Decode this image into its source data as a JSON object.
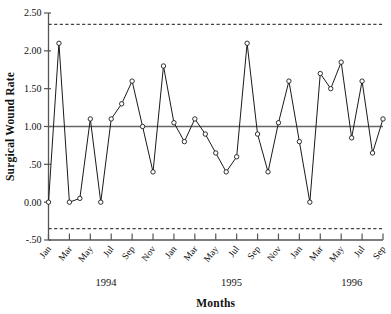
{
  "chart_data": {
    "type": "line",
    "title": "",
    "subtitle": "",
    "xlabel": "Months",
    "ylabel": "Surgical Wound Rate",
    "ylim": [
      -0.5,
      2.5
    ],
    "ytick_labels": [
      "2.50",
      "2.00",
      "1.50",
      "1.00",
      ".50",
      "0.00",
      "-.50"
    ],
    "ytick_values": [
      2.5,
      2.0,
      1.5,
      1.0,
      0.5,
      0.0,
      -0.5
    ],
    "grid": false,
    "legend_position": "none",
    "marker": "open-circle",
    "x": [
      "Jan 1994",
      "Feb 1994",
      "Mar 1994",
      "Apr 1994",
      "May 1994",
      "Jun 1994",
      "Jul 1994",
      "Aug 1994",
      "Sep 1994",
      "Oct 1994",
      "Nov 1994",
      "Dec 1994",
      "Jan 1995",
      "Feb 1995",
      "Mar 1995",
      "Apr 1995",
      "May 1995",
      "Jun 1995",
      "Jul 1995",
      "Aug 1995",
      "Sep 1995",
      "Oct 1995",
      "Nov 1995",
      "Dec 1995",
      "Jan 1996",
      "Feb 1996",
      "Mar 1996",
      "Apr 1996",
      "May 1996",
      "Jun 1996",
      "Jul 1996",
      "Aug 1996",
      "Sep 1996"
    ],
    "xtick_labels": [
      "Jan",
      "Mar",
      "May",
      "Jul",
      "Sep",
      "Nov",
      "Jan",
      "Mar",
      "May",
      "Jul",
      "Sep",
      "Nov",
      "Jan",
      "Mar",
      "May",
      "Jul",
      "Sep"
    ],
    "xtick_indices": [
      0,
      2,
      4,
      6,
      8,
      10,
      12,
      14,
      16,
      18,
      20,
      22,
      24,
      26,
      28,
      30,
      32
    ],
    "year_groups": [
      {
        "label": "1994",
        "center_index": 5.5
      },
      {
        "label": "1995",
        "center_index": 17.5
      },
      {
        "label": "1996",
        "center_index": 29.0
      }
    ],
    "values": [
      0.0,
      2.1,
      0.0,
      0.05,
      1.1,
      0.0,
      1.1,
      1.3,
      1.6,
      1.0,
      0.4,
      1.8,
      1.05,
      0.8,
      1.1,
      0.9,
      0.65,
      0.4,
      0.6,
      2.1,
      0.9,
      0.4,
      1.05,
      1.6,
      0.8,
      0.0,
      1.7,
      1.5,
      1.85,
      0.85,
      1.6,
      0.65,
      1.1
    ],
    "reference_lines": [
      {
        "name": "upper-control-limit",
        "value": 2.35,
        "style": "dashed"
      },
      {
        "name": "center-line",
        "value": 1.0,
        "style": "solid"
      },
      {
        "name": "lower-control-limit",
        "value": -0.35,
        "style": "dashed"
      }
    ],
    "colors": {
      "series": "#1a1a1a",
      "marker_fill": "#ffffff",
      "axis": "#555555",
      "center_line": "#666666",
      "limit_line": "#444444",
      "background": "#ffffff"
    }
  }
}
